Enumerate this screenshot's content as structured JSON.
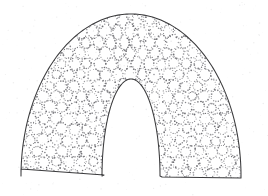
{
  "document": {
    "title": "Stippled Arch Cross-Section",
    "background_color": "#ffffff",
    "width": 268,
    "height": 196,
    "media": "scanned line drawing"
  },
  "figure": {
    "name": "arch-cross-section",
    "outline_color": "#3a3a3c",
    "fill_color": "#ffffff",
    "stipple_color": "#6b6b70",
    "stroke_width": 1.05,
    "geometry": {
      "center_x": 131,
      "center_y": 176,
      "outer_radius_x": 110,
      "outer_radius_y": 162,
      "inner_radius_x": 29,
      "inner_radius_y": 97,
      "crown_top_y": 14,
      "inner_crown_top_y": 80,
      "base_y": 177,
      "outer_left_x": 21,
      "outer_right_x": 241,
      "inner_left_x": 104,
      "inner_right_x": 162,
      "base_left_outer_x": 21,
      "base_left_inner_x": 104,
      "base_right_inner_x": 162,
      "base_right_outer_x": 241,
      "leg_bottom_bevel": 8
    },
    "pattern": {
      "name": "dotted-ring-stipple",
      "ring_radius": 5.2,
      "ring_spacing": 12.4,
      "dot_radius": 0.62,
      "dots_per_ring": 13,
      "stretch_zone_start_angle_deg": 52,
      "stretch_zone_end_angle_deg": 128,
      "stretch_factor": 2.1
    }
  },
  "labels": {
    "figure_caption": "",
    "axis_labels": [],
    "annotations": []
  }
}
